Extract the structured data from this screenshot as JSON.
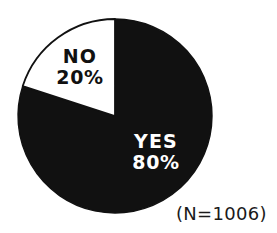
{
  "chart_data": {
    "type": "pie",
    "title": "",
    "subtitle": "",
    "xlabel": "",
    "ylabel": "",
    "legend_position": "none",
    "grid": false,
    "categories": [
      "YES",
      "NO"
    ],
    "values": [
      80,
      20
    ],
    "slices": [
      {
        "name": "YES",
        "value": 80,
        "value_label": "80%",
        "color": "#111111",
        "label_color": "#ffffff",
        "start_angle_deg": 0,
        "end_angle_deg": 288
      },
      {
        "name": "NO",
        "value": 20,
        "value_label": "20%",
        "color": "#ffffff",
        "label_color": "#111111",
        "start_angle_deg": 288,
        "end_angle_deg": 360
      }
    ],
    "annotations": [
      {
        "name": "sample-size",
        "text": "(N=1006)"
      }
    ],
    "geometry": {
      "center_x": 115,
      "center_y": 116,
      "radius": 97
    }
  },
  "figure": {
    "caption": "(N=1006)",
    "background_color": "#ffffff",
    "outline_color": "#111111"
  }
}
